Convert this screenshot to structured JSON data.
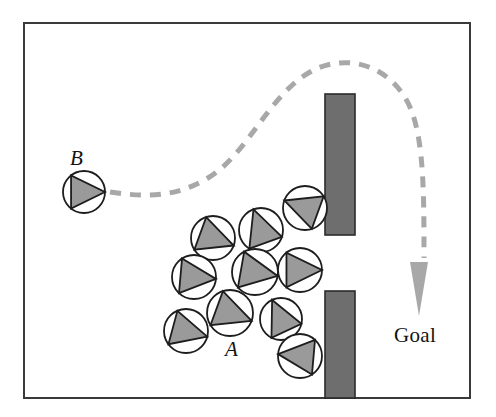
{
  "figure": {
    "canvas": {
      "width": 496,
      "height": 417,
      "background": "#ffffff"
    },
    "frame": {
      "x": 24,
      "y": 23,
      "width": 446,
      "height": 375,
      "stroke": "#3a3a3a",
      "stroke_width": 2,
      "fill": "#ffffff"
    },
    "colors": {
      "obstacle_fill": "#6e6e6e",
      "obstacle_stroke": "#2b2b2b",
      "robot_body_fill": "#ffffff",
      "robot_body_stroke": "#1d1d1d",
      "robot_heading_fill": "#9a9a9a",
      "robot_heading_stroke": "#1d1d1d",
      "path_stroke": "#a8a8a8",
      "arrow_fill": "#a8a8a8",
      "text": "#131313"
    },
    "labels": [
      {
        "id": "label-B",
        "text": "B",
        "x": 70,
        "y": 148,
        "style": "italic"
      },
      {
        "id": "label-A",
        "text": "A",
        "x": 225,
        "y": 339,
        "style": "italic"
      },
      {
        "id": "label-goal",
        "text": "Goal",
        "x": 394,
        "y": 325,
        "style": "roman"
      }
    ],
    "obstacles": [
      {
        "name": "upper-wall",
        "x": 325,
        "y": 94,
        "width": 30,
        "height": 141
      },
      {
        "name": "lower-wall",
        "x": 325,
        "y": 291,
        "width": 30,
        "height": 107
      }
    ],
    "path": {
      "name": "planned-trajectory",
      "dash": "11 9",
      "stroke_width": 5,
      "d": "M 110 192 C 150 198 178 196 208 178 C 248 154 268 96 310 72 C 342 54 382 62 404 96 C 424 126 424 186 424 258"
    },
    "goal_arrow": {
      "name": "goal-arrow",
      "tip_x": 419,
      "tip_y": 316,
      "base_y": 262,
      "half_width": 9
    },
    "robots": [
      {
        "id": "robot-B",
        "group": "B",
        "cx": 84,
        "cy": 192,
        "r": 21,
        "heading_deg": 0
      },
      {
        "id": "robot-A-1",
        "group": "A",
        "cx": 305,
        "cy": 208,
        "r": 22,
        "heading_deg": 200
      },
      {
        "id": "robot-A-2",
        "group": "A",
        "cx": 261,
        "cy": 230,
        "r": 22,
        "heading_deg": 250
      },
      {
        "id": "robot-A-3",
        "group": "A",
        "cx": 213,
        "cy": 238,
        "r": 22,
        "heading_deg": 20
      },
      {
        "id": "robot-A-4",
        "group": "A",
        "cx": 194,
        "cy": 277,
        "r": 22,
        "heading_deg": 5
      },
      {
        "id": "robot-A-5",
        "group": "A",
        "cx": 255,
        "cy": 272,
        "r": 23,
        "heading_deg": 10
      },
      {
        "id": "robot-A-6",
        "group": "A",
        "cx": 300,
        "cy": 270,
        "r": 22,
        "heading_deg": 0
      },
      {
        "id": "robot-A-7",
        "group": "A",
        "cx": 230,
        "cy": 313,
        "r": 23,
        "heading_deg": 20
      },
      {
        "id": "robot-A-8",
        "group": "A",
        "cx": 281,
        "cy": 319,
        "r": 21,
        "heading_deg": 245
      },
      {
        "id": "robot-A-9",
        "group": "A",
        "cx": 186,
        "cy": 331,
        "r": 22,
        "heading_deg": 15
      },
      {
        "id": "robot-A-10",
        "group": "A",
        "cx": 300,
        "cy": 356,
        "r": 22,
        "heading_deg": 185
      }
    ]
  }
}
